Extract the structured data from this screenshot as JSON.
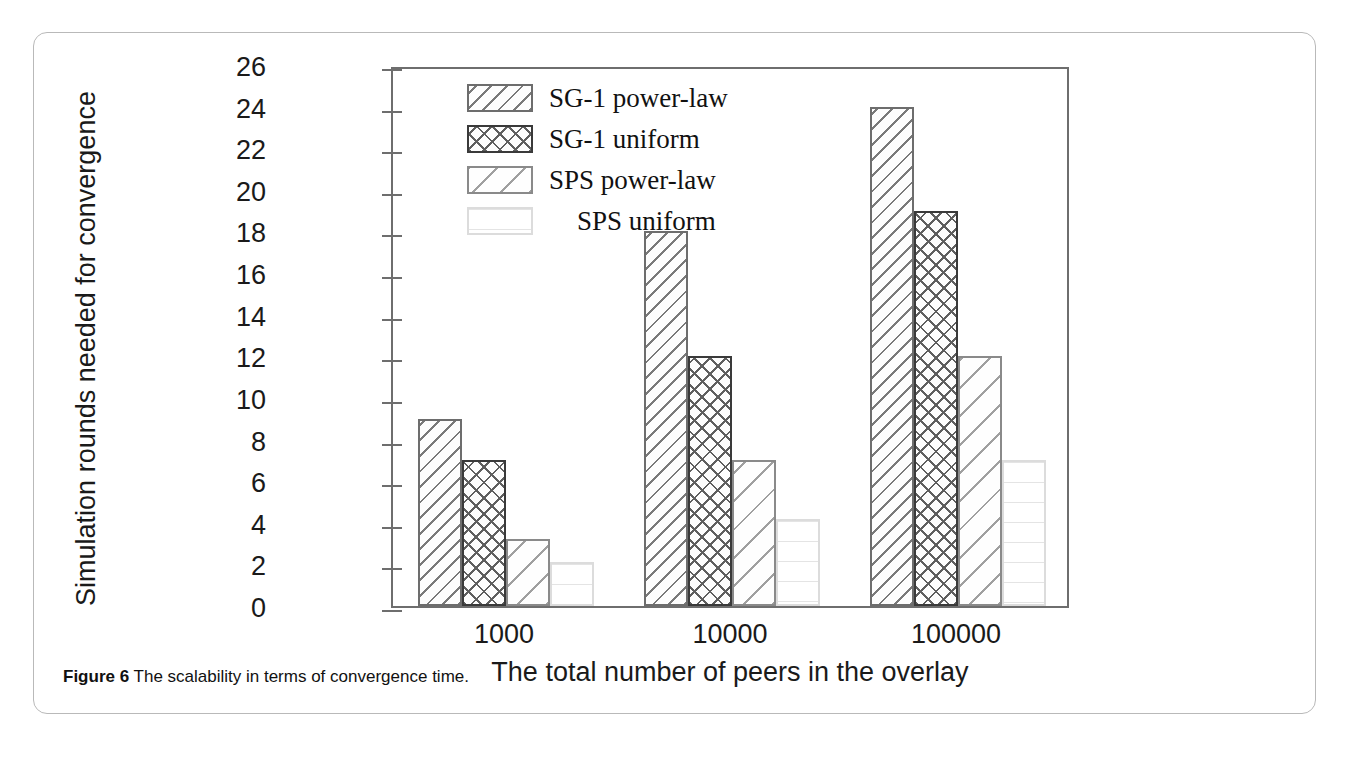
{
  "figure": {
    "caption_label": "Figure 6",
    "caption_text": "The scalability in terms of convergence time."
  },
  "chart_data": {
    "type": "bar",
    "title": "",
    "xlabel": "The total number of peers in the overlay",
    "ylabel": "Simulation rounds needed for convergence",
    "categories": [
      "1000",
      "10000",
      "100000"
    ],
    "ylim": [
      0,
      26
    ],
    "yticks": [
      0,
      2,
      4,
      6,
      8,
      10,
      12,
      14,
      16,
      18,
      20,
      22,
      24,
      26
    ],
    "ytick_labels": [
      "0",
      "2",
      "4",
      "6",
      "8",
      "10",
      "12",
      "14",
      "16",
      "18",
      "20",
      "22",
      "24",
      "26"
    ],
    "grid": false,
    "legend_position": "top-left-inside",
    "series": [
      {
        "name": "SG-1 power-law",
        "pattern": "diagonal-dense",
        "values": [
          9,
          18,
          24
        ]
      },
      {
        "name": "SG-1 uniform",
        "pattern": "cross-hatch",
        "values": [
          7,
          12,
          19
        ]
      },
      {
        "name": "SPS power-law",
        "pattern": "diagonal-sparse",
        "values": [
          3.2,
          7,
          12
        ]
      },
      {
        "name": "SPS uniform",
        "pattern": "horizontal-light",
        "values": [
          2.1,
          4.2,
          7
        ]
      }
    ]
  }
}
